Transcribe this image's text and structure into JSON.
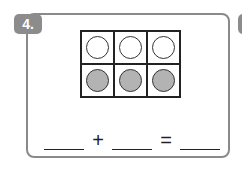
{
  "problem": {
    "number_label": "4.",
    "ten_frame": {
      "rows": 2,
      "cols": 3,
      "cells": [
        [
          "empty",
          "empty",
          "empty"
        ],
        [
          "filled",
          "filled",
          "filled"
        ]
      ]
    },
    "equation": {
      "blank_1": "",
      "operator_1": "+",
      "blank_2": "",
      "operator_2": "=",
      "blank_3": ""
    }
  },
  "colors": {
    "badge": "#8c8c8c",
    "filled_counter": "#b3b3b3",
    "card_border": "#8a8a8a"
  }
}
